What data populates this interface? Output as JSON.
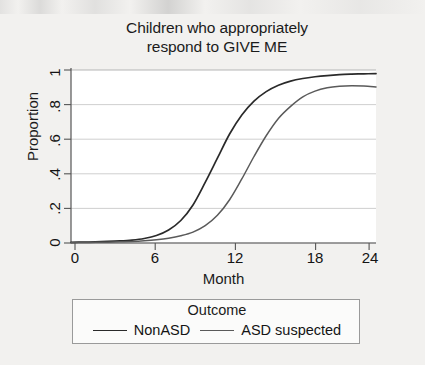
{
  "chart_data": {
    "type": "line",
    "title": "Children who appropriately respond to GIVE ME",
    "title_line1": "Children who appropriately",
    "title_line2": "respond to GIVE ME",
    "xlabel": "Month",
    "ylabel": "Proportion",
    "xlim": [
      0,
      25
    ],
    "ylim": [
      0,
      1
    ],
    "xticks": [
      0,
      6,
      12,
      18,
      24
    ],
    "xtick_labels": [
      "0",
      "6",
      "12",
      "18",
      "24"
    ],
    "yticks": [
      0,
      0.2,
      0.4,
      0.6,
      0.8,
      1
    ],
    "ytick_labels": [
      "0",
      ".2",
      ".4",
      ".6",
      ".8",
      "1"
    ],
    "grid": "horizontal",
    "legend_position": "below-plot",
    "legend_title": "Outcome",
    "series": [
      {
        "name": "NonASD",
        "color": "#2a2a2a",
        "x": [
          0,
          1,
          2,
          3,
          4,
          5,
          6,
          7,
          8,
          9,
          10,
          11,
          12,
          13,
          14,
          15,
          16,
          17,
          18,
          19,
          20,
          21,
          22,
          23,
          24,
          25
        ],
        "values": [
          0.004,
          0.005,
          0.007,
          0.009,
          0.012,
          0.017,
          0.026,
          0.043,
          0.075,
          0.13,
          0.22,
          0.35,
          0.49,
          0.63,
          0.74,
          0.82,
          0.875,
          0.912,
          0.936,
          0.951,
          0.961,
          0.968,
          0.973,
          0.976,
          0.978,
          0.979
        ]
      },
      {
        "name": "ASD suspected",
        "color": "#5a5a5a",
        "x": [
          0,
          1,
          2,
          3,
          4,
          5,
          6,
          7,
          8,
          9,
          10,
          11,
          12,
          13,
          14,
          15,
          16,
          17,
          18,
          19,
          20,
          21,
          22,
          23,
          24,
          25
        ],
        "values": [
          0.002,
          0.003,
          0.004,
          0.005,
          0.007,
          0.009,
          0.013,
          0.019,
          0.028,
          0.042,
          0.063,
          0.1,
          0.16,
          0.25,
          0.37,
          0.5,
          0.62,
          0.72,
          0.79,
          0.845,
          0.878,
          0.897,
          0.906,
          0.909,
          0.907,
          0.902
        ]
      }
    ],
    "annotations": []
  },
  "legend": {
    "title": "Outcome",
    "entries": [
      {
        "label": "NonASD"
      },
      {
        "label": "ASD suspected"
      }
    ]
  }
}
